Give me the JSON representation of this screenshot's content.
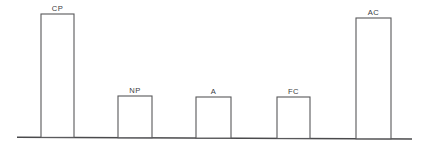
{
  "chart_data": {
    "type": "bar",
    "title": "",
    "subtitle": "",
    "xlabel": "",
    "ylabel": "",
    "grid": false,
    "legend": false,
    "axis_style": "single horizontal baseline only, no y-axis, no tick labels",
    "bar_style": "unfilled white rectangles with thin dark outline",
    "label_position": "above each bar",
    "categories": [
      "CP",
      "NP",
      "A",
      "FC",
      "AC"
    ],
    "values": [
      100,
      34,
      33,
      33,
      97
    ],
    "ylim": [
      0,
      105
    ],
    "bars": [
      {
        "label": "CP",
        "value": 100,
        "x_left": 41,
        "x_right": 74,
        "y_top": 14
      },
      {
        "label": "NP",
        "value": 34,
        "x_left": 118,
        "x_right": 152,
        "y_top": 96
      },
      {
        "label": "A",
        "value": 33,
        "x_left": 196,
        "x_right": 231,
        "y_top": 97
      },
      {
        "label": "FC",
        "value": 33,
        "x_left": 277,
        "x_right": 310,
        "y_top": 97
      },
      {
        "label": "AC",
        "value": 97,
        "x_left": 356,
        "x_right": 391,
        "y_top": 18
      }
    ],
    "baseline_y": 138,
    "baseline_x_start": 17,
    "baseline_x_end": 412
  },
  "colors": {
    "background": "#ffffff",
    "bar_stroke": "#58585a",
    "bar_fill": "#ffffff",
    "baseline": "#4a4a4c",
    "label_text": "#3d3d3f"
  }
}
